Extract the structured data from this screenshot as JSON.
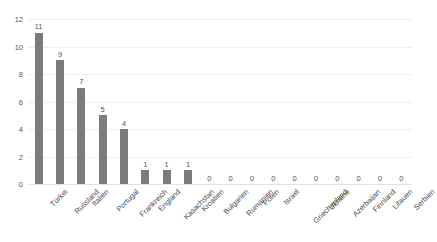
{
  "chart_data": {
    "type": "bar",
    "title": "",
    "subtitle": "",
    "xlabel": "",
    "ylabel": "",
    "ylim": [
      0,
      12
    ],
    "yticks": [
      0,
      2,
      4,
      6,
      8,
      10,
      12
    ],
    "grid": true,
    "legend": false,
    "legend_position": "none",
    "bar_color": "#7b7b7b",
    "gridline_color": "#efefef",
    "axis_color": "#e2e2e2",
    "data_labels": true,
    "categories": [
      "Türkei",
      "Russland",
      "Italien",
      "Portugal",
      "Frankreich",
      "England",
      "Kasachstan",
      "Kroatien",
      "Bulgarien",
      "Rumänien",
      "Polen",
      "Israel",
      "Griechenland",
      "Ukraine",
      "Azerbaijan",
      "Finnland",
      "Litauen",
      "Serbien"
    ],
    "values": [
      11,
      9,
      7,
      5,
      4,
      1,
      1,
      1,
      0,
      0,
      0,
      0,
      0,
      0,
      0,
      0,
      0,
      0
    ],
    "value_labels": [
      "11",
      "9",
      "7",
      "5",
      "4",
      "1",
      "1",
      "1",
      "0",
      "0",
      "0",
      "0",
      "0",
      "0",
      "0",
      "0",
      "0",
      "0"
    ],
    "ytick_labels": [
      "0",
      "2",
      "4",
      "6",
      "8",
      "10",
      "12"
    ]
  }
}
